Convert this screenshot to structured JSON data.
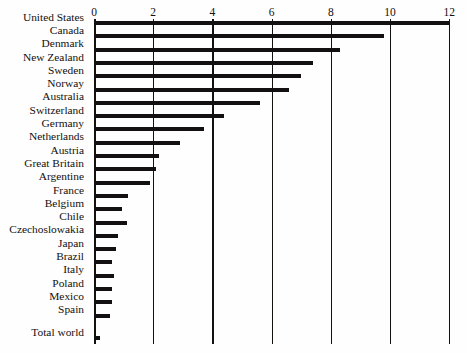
{
  "chart": {
    "title": "",
    "title_remnant": "",
    "axis": {
      "xlabel": "",
      "ylabel": "",
      "ticks": [
        "0",
        "2",
        "4",
        "6",
        "8",
        "10",
        "12"
      ],
      "xmin": 0,
      "xmax": 12,
      "grid": true
    },
    "colors": {
      "bar": "#121010",
      "axis": "#15110f",
      "text": "#13100e",
      "background": "#fefefe"
    }
  },
  "chart_data": {
    "type": "bar",
    "orientation": "horizontal",
    "title": "",
    "xlabel": "",
    "ylabel": "",
    "xlim": [
      0,
      12
    ],
    "grid": true,
    "legend": null,
    "categories": [
      "United States",
      "Canada",
      "Denmark",
      "New Zealand",
      "Sweden",
      "Norway",
      "Australia",
      "Switzerland",
      "Germany",
      "Netherlands",
      "Austria",
      "Great Britain",
      "Argentine",
      "France",
      "Belgium",
      "Chile",
      "Czechoslowakia",
      "Japan",
      "Brazil",
      "Italy",
      "Poland",
      "Mexico",
      "Spain",
      "Total world"
    ],
    "values": [
      12.0,
      9.8,
      8.3,
      7.4,
      7.0,
      6.6,
      5.6,
      4.4,
      3.7,
      2.9,
      2.2,
      2.1,
      1.9,
      1.15,
      0.95,
      1.1,
      0.8,
      0.75,
      0.62,
      0.68,
      0.6,
      0.62,
      0.55,
      0.2
    ],
    "separated_last_category": "Total world",
    "total_world_value": 0.95,
    "tick_labels": [
      "0",
      "2",
      "4",
      "6",
      "8",
      "10",
      "12"
    ],
    "annotations": []
  },
  "labels": {
    "rows": [
      {
        "name": "United States",
        "value": 12.0
      },
      {
        "name": "Canada",
        "value": 9.8
      },
      {
        "name": "Denmark",
        "value": 8.3
      },
      {
        "name": "New Zealand",
        "value": 7.4
      },
      {
        "name": "Sweden",
        "value": 7.0
      },
      {
        "name": "Norway",
        "value": 6.6
      },
      {
        "name": "Australia",
        "value": 5.6
      },
      {
        "name": "Switzerland",
        "value": 4.4
      },
      {
        "name": "Germany",
        "value": 3.7
      },
      {
        "name": "Netherlands",
        "value": 2.9
      },
      {
        "name": "Austria",
        "value": 2.2
      },
      {
        "name": "Great Britain",
        "value": 2.1
      },
      {
        "name": "Argentine",
        "value": 1.9
      },
      {
        "name": "France",
        "value": 1.15
      },
      {
        "name": "Belgium",
        "value": 0.95
      },
      {
        "name": "Chile",
        "value": 1.1
      },
      {
        "name": "Czechoslowakia",
        "value": 0.8
      },
      {
        "name": "Japan",
        "value": 0.75
      },
      {
        "name": "Brazil",
        "value": 0.62
      },
      {
        "name": "Italy",
        "value": 0.68
      },
      {
        "name": "Poland",
        "value": 0.6
      },
      {
        "name": "Mexico",
        "value": 0.62
      },
      {
        "name": "Spain",
        "value": 0.55
      },
      {
        "name": "Total world",
        "value": 0.95
      }
    ]
  }
}
